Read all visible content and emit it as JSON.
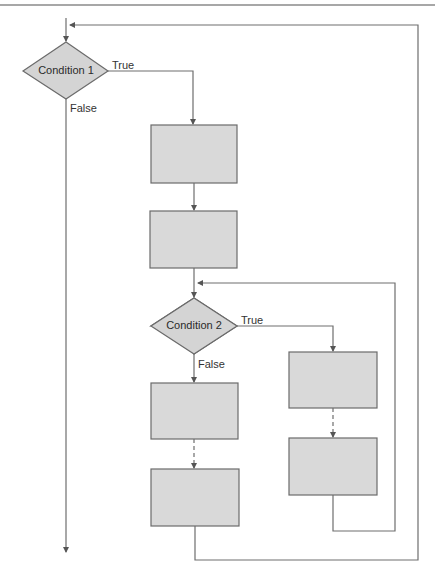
{
  "diagram": {
    "type": "flowchart",
    "colors": {
      "line": "#6e6e6e",
      "box_fill": "#d9d9d9",
      "diamond_fill": "#d4d4d4",
      "text": "#333333"
    },
    "decisions": [
      {
        "id": "condition-1",
        "label": "Condition 1",
        "true_label": "True",
        "false_label": "False"
      },
      {
        "id": "condition-2",
        "label": "Condition 2",
        "true_label": "True",
        "false_label": "False"
      }
    ],
    "process_boxes": [
      {
        "id": "box-1",
        "label": ""
      },
      {
        "id": "box-2",
        "label": ""
      },
      {
        "id": "box-3",
        "label": ""
      },
      {
        "id": "box-4",
        "label": ""
      },
      {
        "id": "box-5",
        "label": ""
      },
      {
        "id": "box-6",
        "label": ""
      }
    ],
    "caption_clipped": ""
  }
}
